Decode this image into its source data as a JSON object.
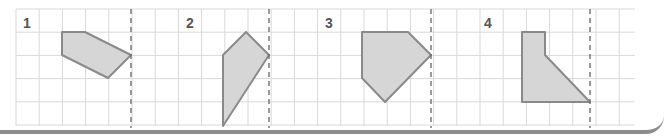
{
  "diagram": {
    "type": "symmetry-completion-exercise",
    "instructions": "",
    "grid": {
      "origin_x": 16,
      "origin_y": 9,
      "cell": 23.2,
      "cols": 27,
      "rows": 5,
      "line_color": "#d9d9d9"
    },
    "colors": {
      "shape_fill": "#d6d6d6",
      "shape_stroke": "#8a8a8a",
      "mirror_line": "#666666",
      "label": "#555555",
      "frame": "#8c8c8c"
    },
    "panels": [
      {
        "label": "1",
        "label_pos": [
          23,
          32
        ],
        "mirror_x": 131,
        "shape_points": [
          [
            62,
            32
          ],
          [
            85,
            32
          ],
          [
            131,
            55
          ],
          [
            108,
            78
          ],
          [
            62,
            55
          ]
        ]
      },
      {
        "label": "2",
        "label_pos": [
          186,
          32
        ],
        "mirror_x": 269,
        "shape_points": [
          [
            246,
            32
          ],
          [
            269,
            55
          ],
          [
            223,
            126
          ],
          [
            223,
            55
          ]
        ]
      },
      {
        "label": "3",
        "label_pos": [
          325,
          32
        ],
        "mirror_x": 431,
        "shape_points": [
          [
            362,
            32
          ],
          [
            408,
            32
          ],
          [
            431,
            55
          ],
          [
            385,
            102
          ],
          [
            362,
            78
          ]
        ]
      },
      {
        "label": "4",
        "label_pos": [
          484,
          32
        ],
        "mirror_x": 590,
        "shape_points": [
          [
            522,
            32
          ],
          [
            545,
            32
          ],
          [
            545,
            55
          ],
          [
            590,
            102
          ],
          [
            522,
            102
          ]
        ]
      }
    ]
  }
}
